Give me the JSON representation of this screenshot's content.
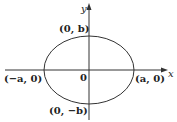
{
  "diagram": {
    "type": "ellipse-on-axes",
    "axes": {
      "x_label": "x",
      "y_label": "y"
    },
    "origin_label": "0",
    "points": [
      {
        "id": "top",
        "label": "(0, b)"
      },
      {
        "id": "bottom",
        "label": "(0, −b)"
      },
      {
        "id": "left",
        "label": "(−a, 0)"
      },
      {
        "id": "right",
        "label": "(a, 0)"
      }
    ],
    "colors": {
      "stroke": "#333333",
      "background": "#ffffff"
    }
  }
}
